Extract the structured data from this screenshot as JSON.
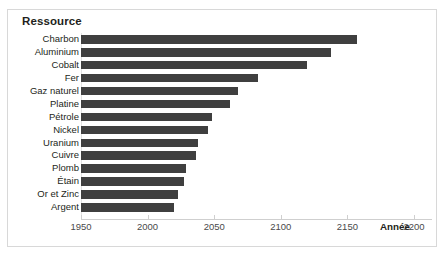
{
  "panel": {
    "title": "Ressource",
    "border_color": "#d8d8d8",
    "background": "#ffffff"
  },
  "colors": {
    "bar": "#3f3f3f",
    "text": "#231f20",
    "axis": "#cfcfcf",
    "tick_label": "#4a4a4a"
  },
  "axis": {
    "title": "Année",
    "ticks": [
      1950,
      2000,
      2050,
      2100,
      2150,
      2200
    ],
    "min": 1950,
    "max": 2215
  },
  "chart_data": {
    "type": "bar",
    "orientation": "horizontal",
    "title": "Ressource",
    "xlabel": "Année",
    "ylabel": "Ressource",
    "xlim": [
      1950,
      2215
    ],
    "grid": false,
    "legend": null,
    "xticks": [
      1950,
      2000,
      2050,
      2100,
      2150,
      2200
    ],
    "categories": [
      "Charbon",
      "Aluminium",
      "Cobalt",
      "Fer",
      "Gaz naturel",
      "Platine",
      "Pétrole",
      "Nickel",
      "Uranium",
      "Cuivre",
      "Plomb",
      "Étain",
      "Or et Zinc",
      "Argent"
    ],
    "values": [
      2157,
      2138,
      2120,
      2083,
      2068,
      2062,
      2048,
      2045,
      2038,
      2036,
      2029,
      2027,
      2023,
      2020
    ],
    "bar_baseline": 1950
  }
}
